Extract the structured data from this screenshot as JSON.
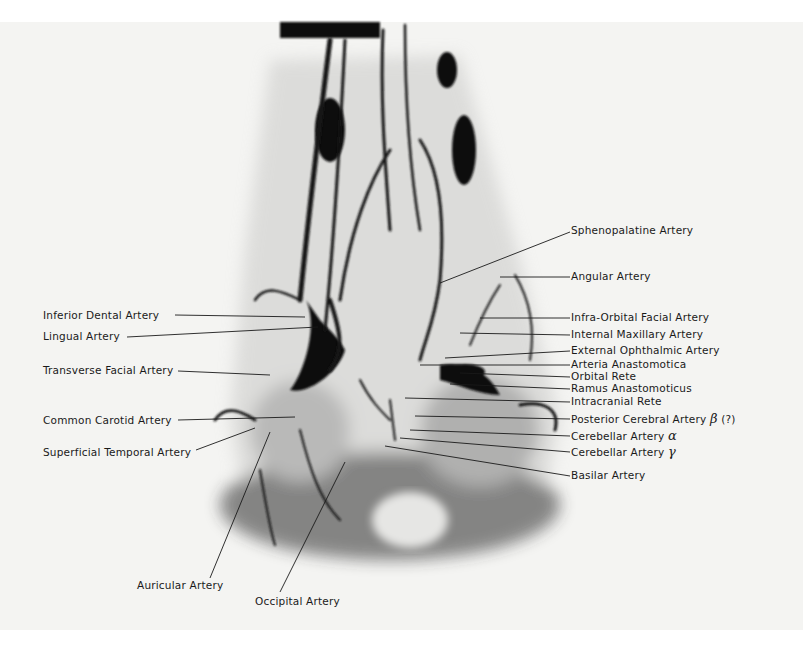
{
  "figure": {
    "type": "angiogram radiograph",
    "background": "#f4f4f2",
    "ink": "#1a1a1a"
  },
  "labels_left": [
    {
      "text": "Inferior Dental Artery",
      "x": 43,
      "y": 310
    },
    {
      "text": "Lingual Artery",
      "x": 43,
      "y": 330
    },
    {
      "text": "Transverse Facial Artery",
      "x": 43,
      "y": 365
    },
    {
      "text": "Common Carotid Artery",
      "x": 43,
      "y": 415
    },
    {
      "text": "Superficial Temporal Artery",
      "x": 43,
      "y": 447
    }
  ],
  "labels_right": [
    {
      "text": "Sphenopalatine Artery",
      "y": 224
    },
    {
      "text": "Angular Artery",
      "y": 270
    },
    {
      "text": "Infra-Orbital Facial Artery",
      "y": 312
    },
    {
      "text": "Internal Maxillary Artery",
      "y": 329
    },
    {
      "text": "External Ophthalmic Artery",
      "y": 345
    },
    {
      "text": "Arteria Anastomotica",
      "y": 359
    },
    {
      "text": "Orbital Rete",
      "y": 371
    },
    {
      "text": "Ramus Anastomoticus",
      "y": 383
    },
    {
      "text": "Intracranial Rete",
      "y": 396
    },
    {
      "text": "Posterior Cerebral Artery",
      "greek": "β",
      "suffix": " (?)",
      "y": 413
    },
    {
      "text": "Cerebellar Artery",
      "greek": "α",
      "y": 430
    },
    {
      "text": "Cerebellar Artery",
      "greek": "γ",
      "y": 446
    },
    {
      "text": "Basilar Artery",
      "y": 470
    }
  ],
  "labels_bottom": [
    {
      "text": "Auricular Artery",
      "x": 137,
      "y": 580
    },
    {
      "text": "Occipital Artery",
      "x": 255,
      "y": 595
    }
  ]
}
